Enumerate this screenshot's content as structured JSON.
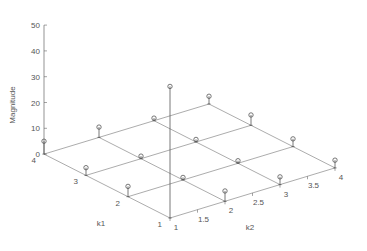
{
  "chart_data": {
    "type": "stem3",
    "title": "",
    "xlabel": "k2",
    "ylabel": "k1",
    "zlabel": "Magnitude",
    "zlim": [
      0,
      50
    ],
    "z_ticks": [
      0,
      10,
      20,
      30,
      40,
      50
    ],
    "k1_ticks": [
      "1",
      "2",
      "3",
      "4"
    ],
    "k2_ticks": [
      "1",
      "1.5",
      "2",
      "2.5",
      "3",
      "3.5",
      "4"
    ],
    "grid": true,
    "k1": [
      1,
      2,
      3,
      4
    ],
    "k2": [
      1,
      2,
      3,
      4
    ],
    "points": [
      {
        "k1": 1,
        "k2": 1,
        "magnitude": 51
      },
      {
        "k1": 1,
        "k2": 2,
        "magnitude": 4
      },
      {
        "k1": 1,
        "k2": 3,
        "magnitude": 3
      },
      {
        "k1": 1,
        "k2": 4,
        "magnitude": 3
      },
      {
        "k1": 2,
        "k2": 1,
        "magnitude": 4
      },
      {
        "k1": 2,
        "k2": 2,
        "magnitude": 1
      },
      {
        "k1": 2,
        "k2": 3,
        "magnitude": 1
      },
      {
        "k1": 2,
        "k2": 4,
        "magnitude": 3
      },
      {
        "k1": 3,
        "k2": 1,
        "magnitude": 3
      },
      {
        "k1": 3,
        "k2": 2,
        "magnitude": 1
      },
      {
        "k1": 3,
        "k2": 3,
        "magnitude": 1
      },
      {
        "k1": 3,
        "k2": 4,
        "magnitude": 4
      },
      {
        "k1": 4,
        "k2": 1,
        "magnitude": 5
      },
      {
        "k1": 4,
        "k2": 2,
        "magnitude": 4
      },
      {
        "k1": 4,
        "k2": 3,
        "magnitude": 1
      },
      {
        "k1": 4,
        "k2": 4,
        "magnitude": 3
      }
    ]
  },
  "colors": {
    "axis": "#666666",
    "grid": "#888888",
    "stem": "#555555",
    "text": "#555555"
  }
}
